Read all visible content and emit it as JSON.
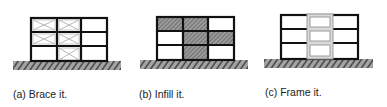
{
  "figure": {
    "panels": [
      {
        "id": "a",
        "caption": "(a) Brace it.",
        "strategy": "brace",
        "grid": {
          "stories": 3,
          "bays": 3
        },
        "braced_cells": [
          [
            0,
            0
          ],
          [
            0,
            1
          ],
          [
            1,
            0
          ],
          [
            1,
            1
          ],
          [
            2,
            1
          ]
        ]
      },
      {
        "id": "b",
        "caption": "(b) Infill it.",
        "strategy": "infill",
        "grid": {
          "stories": 3,
          "bays": 3
        },
        "infilled_cells": [
          [
            0,
            0
          ],
          [
            0,
            1
          ],
          [
            1,
            1
          ],
          [
            1,
            2
          ],
          [
            2,
            1
          ]
        ]
      },
      {
        "id": "c",
        "caption": "(c) Frame it.",
        "strategy": "frame",
        "grid": {
          "stories": 3,
          "bays": 3
        },
        "framed_bay": 1
      }
    ],
    "colors": {
      "frame_line": "#111111",
      "brace_line": "#b8b8b8",
      "infill_fill": "#8a8a8a",
      "ground_fill": "#9a9a9a",
      "ground_hatch": "#222222",
      "moment_frame": "#9c9c9c",
      "moment_frame_fill": "#d9d9d9"
    }
  }
}
